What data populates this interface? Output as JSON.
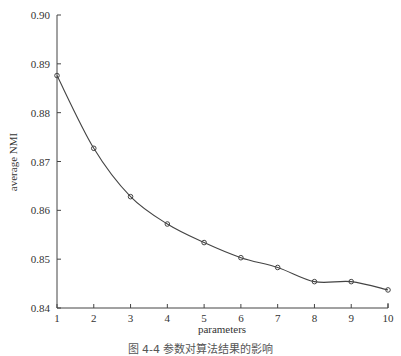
{
  "chart_data": {
    "type": "line",
    "title": "",
    "xlabel": "parameters",
    "ylabel": "average NMI",
    "x": [
      1,
      2,
      3,
      4,
      5,
      6,
      7,
      8,
      9,
      10
    ],
    "series": [
      {
        "name": "average NMI",
        "values": [
          0.8876,
          0.8727,
          0.8628,
          0.8572,
          0.8534,
          0.8503,
          0.8483,
          0.8454,
          0.8454,
          0.8437
        ],
        "marker": "circle",
        "color": "#444444"
      }
    ],
    "xlim": [
      1,
      10
    ],
    "ylim": [
      0.84,
      0.9
    ],
    "xticks": [
      "1",
      "2",
      "3",
      "4",
      "5",
      "6",
      "7",
      "8",
      "9",
      "10"
    ],
    "yticks": [
      "0.84",
      "0.85",
      "0.86",
      "0.87",
      "0.88",
      "0.89",
      "0.90"
    ],
    "grid": false,
    "legend": null
  },
  "caption": "图 4-4   参数对算法结果的影响"
}
